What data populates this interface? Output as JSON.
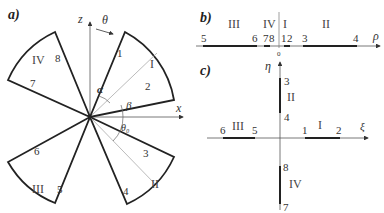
{
  "panels": {
    "a": {
      "label": "a)",
      "axes": {
        "vertical": "z",
        "horizontal": "x",
        "rotation": "θ"
      },
      "angles": {
        "alpha": "α",
        "beta": "β",
        "theta0": "θ₀"
      },
      "sectors": [
        {
          "name": "I",
          "edges": [
            "1",
            "2"
          ]
        },
        {
          "name": "II",
          "edges": [
            "3",
            "4"
          ]
        },
        {
          "name": "III",
          "edges": [
            "5",
            "6"
          ]
        },
        {
          "name": "IV",
          "edges": [
            "7",
            "8"
          ]
        }
      ]
    },
    "b": {
      "label": "b)",
      "axis": "ρ",
      "origin": "0",
      "regions": [
        "III",
        "IV",
        "I",
        "II"
      ],
      "points": [
        "5",
        "6",
        "7",
        "8",
        "1",
        "2",
        "3",
        "4"
      ]
    },
    "c": {
      "label": "c)",
      "axes": {
        "vertical": "η",
        "horizontal": "ξ"
      },
      "segments": [
        {
          "name": "II",
          "start": "3",
          "end": "4"
        },
        {
          "name": "III",
          "start": "6",
          "end": "5"
        },
        {
          "name": "I",
          "start": "1",
          "end": "2"
        },
        {
          "name": "IV",
          "start": "8",
          "end": "7"
        }
      ]
    }
  },
  "colors": {
    "thick_line": "#222222",
    "thin_line": "#555555",
    "bisector": "#aaaaaa"
  }
}
